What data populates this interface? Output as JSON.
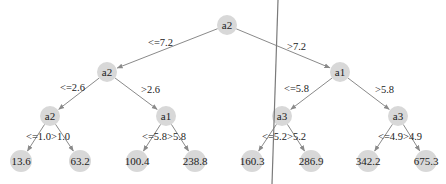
{
  "colors": {
    "node_fill": "#d8d8d8",
    "edge": "#8a8a8a",
    "text": "#222222",
    "divider": "#7a7a7a",
    "background": "#ffffff"
  },
  "tree": {
    "nodes": [
      {
        "id": "n0",
        "label": "a2",
        "x": 227,
        "y": 25,
        "type": "split"
      },
      {
        "id": "n1",
        "label": "a2",
        "x": 107,
        "y": 72,
        "type": "split"
      },
      {
        "id": "n2",
        "label": "a1",
        "x": 340,
        "y": 72,
        "type": "split"
      },
      {
        "id": "n3",
        "label": "a2",
        "x": 50,
        "y": 116,
        "type": "split"
      },
      {
        "id": "n4",
        "label": "a1",
        "x": 166,
        "y": 116,
        "type": "split"
      },
      {
        "id": "n5",
        "label": "a3",
        "x": 282,
        "y": 116,
        "type": "split"
      },
      {
        "id": "n6",
        "label": "a3",
        "x": 398,
        "y": 116,
        "type": "split"
      },
      {
        "id": "n7",
        "label": "13.6",
        "x": 21,
        "y": 161,
        "type": "leaf"
      },
      {
        "id": "n8",
        "label": "63.2",
        "x": 80,
        "y": 161,
        "type": "leaf"
      },
      {
        "id": "n9",
        "label": "100.4",
        "x": 137,
        "y": 161,
        "type": "leaf"
      },
      {
        "id": "n10",
        "label": "238.8",
        "x": 195,
        "y": 161,
        "type": "leaf"
      },
      {
        "id": "n11",
        "label": "160.3",
        "x": 252,
        "y": 161,
        "type": "leaf"
      },
      {
        "id": "n12",
        "label": "286.9",
        "x": 311,
        "y": 161,
        "type": "leaf"
      },
      {
        "id": "n13",
        "label": "342.2",
        "x": 368,
        "y": 161,
        "type": "leaf"
      },
      {
        "id": "n14",
        "label": "675.3",
        "x": 426,
        "y": 161,
        "type": "leaf"
      }
    ],
    "edges": [
      {
        "from": "n0",
        "to": "n1",
        "label": "<=7.2",
        "lx": 148,
        "ly": 46
      },
      {
        "from": "n0",
        "to": "n2",
        "label": ">7.2",
        "lx": 287,
        "ly": 50
      },
      {
        "from": "n1",
        "to": "n3",
        "label": "<=2.6",
        "lx": 60,
        "ly": 91
      },
      {
        "from": "n1",
        "to": "n4",
        "label": ">2.6",
        "lx": 141,
        "ly": 93
      },
      {
        "from": "n2",
        "to": "n5",
        "label": "<=5.8",
        "lx": 284,
        "ly": 92
      },
      {
        "from": "n2",
        "to": "n6",
        "label": ">5.8",
        "lx": 375,
        "ly": 93
      },
      {
        "from": "n3",
        "to": "n7",
        "label": "<=1.0",
        "lx": 26,
        "ly": 140
      },
      {
        "from": "n3",
        "to": "n8",
        "label": ">1.0",
        "lx": 51,
        "ly": 140
      },
      {
        "from": "n4",
        "to": "n9",
        "label": "<=5.8",
        "lx": 142,
        "ly": 140
      },
      {
        "from": "n4",
        "to": "n10",
        "label": ">5.8",
        "lx": 167,
        "ly": 140
      },
      {
        "from": "n5",
        "to": "n11",
        "label": "<=5.2",
        "lx": 262,
        "ly": 140
      },
      {
        "from": "n5",
        "to": "n12",
        "label": ">5.2",
        "lx": 287,
        "ly": 140
      },
      {
        "from": "n6",
        "to": "n13",
        "label": "<=4.9",
        "lx": 378,
        "ly": 140
      },
      {
        "from": "n6",
        "to": "n14",
        "label": ">4.9",
        "lx": 403,
        "ly": 140
      }
    ]
  },
  "divider": {
    "x1": 278,
    "y1": 0,
    "x2": 272,
    "y2": 184
  }
}
